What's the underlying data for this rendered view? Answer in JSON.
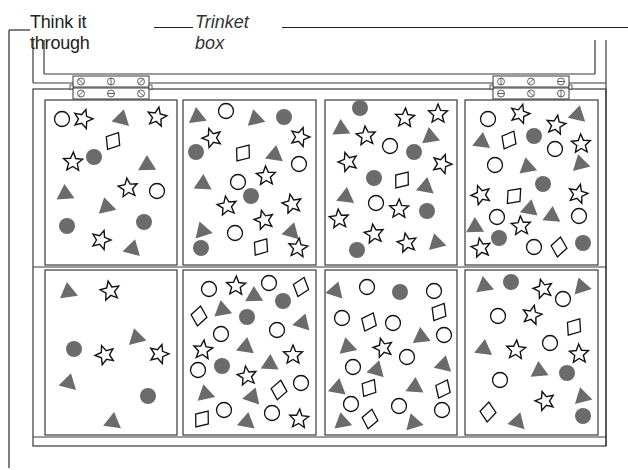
{
  "header": {
    "title": "Think it through",
    "subtitle": "Trinket box"
  },
  "colors": {
    "line": "#3a3a3a",
    "fill_shape": "#6b6b6b",
    "outline_shape": "#111111",
    "background": "#ffffff"
  },
  "compartments": [
    {
      "id": "top-1",
      "x": 45,
      "y": 100,
      "w": 132,
      "h": 165,
      "shapes": [
        [
          "circle-o",
          62,
          119
        ],
        [
          "star",
          83,
          119
        ],
        [
          "tri",
          122,
          117
        ],
        [
          "star",
          157,
          117
        ],
        [
          "diamond",
          113,
          141
        ],
        [
          "circle-f",
          94,
          157
        ],
        [
          "star",
          73,
          162
        ],
        [
          "tri",
          147,
          163
        ],
        [
          "tri",
          65,
          192
        ],
        [
          "star",
          128,
          188
        ],
        [
          "circle-o",
          157,
          191
        ],
        [
          "tri",
          106,
          205
        ],
        [
          "circle-f",
          67,
          226
        ],
        [
          "circle-f",
          144,
          222
        ],
        [
          "star",
          101,
          240
        ],
        [
          "tri",
          133,
          247
        ]
      ]
    },
    {
      "id": "top-2",
      "x": 183,
      "y": 100,
      "w": 133,
      "h": 165,
      "shapes": [
        [
          "tri",
          197,
          115
        ],
        [
          "circle-o",
          226,
          111
        ],
        [
          "tri",
          255,
          117
        ],
        [
          "circle-f",
          284,
          117
        ],
        [
          "star",
          212,
          138
        ],
        [
          "star",
          300,
          137
        ],
        [
          "circle-f",
          196,
          152
        ],
        [
          "diamond",
          243,
          153
        ],
        [
          "tri",
          275,
          153
        ],
        [
          "circle-o",
          299,
          164
        ],
        [
          "tri",
          203,
          182
        ],
        [
          "circle-o",
          238,
          182
        ],
        [
          "star",
          266,
          176
        ],
        [
          "circle-f",
          251,
          196
        ],
        [
          "star",
          227,
          206
        ],
        [
          "star",
          292,
          204
        ],
        [
          "star",
          264,
          220
        ],
        [
          "tri",
          202,
          229
        ],
        [
          "circle-o",
          235,
          233
        ],
        [
          "tri",
          292,
          230
        ],
        [
          "circle-f",
          201,
          248
        ],
        [
          "diamond",
          261,
          247
        ],
        [
          "star",
          298,
          248
        ]
      ]
    },
    {
      "id": "top-3",
      "x": 325,
      "y": 100,
      "w": 132,
      "h": 165,
      "shapes": [
        [
          "circle-f",
          360,
          108
        ],
        [
          "star",
          405,
          118
        ],
        [
          "star",
          438,
          114
        ],
        [
          "tri",
          341,
          127
        ],
        [
          "star",
          366,
          136
        ],
        [
          "tri",
          430,
          135
        ],
        [
          "circle-o",
          390,
          146
        ],
        [
          "circle-f",
          414,
          152
        ],
        [
          "star",
          348,
          162
        ],
        [
          "star",
          442,
          164
        ],
        [
          "circle-f",
          374,
          178
        ],
        [
          "diamond",
          402,
          180
        ],
        [
          "tri",
          426,
          185
        ],
        [
          "tri",
          346,
          195
        ],
        [
          "circle-o",
          376,
          203
        ],
        [
          "star",
          399,
          209
        ],
        [
          "circle-f",
          427,
          211
        ],
        [
          "star",
          339,
          219
        ],
        [
          "star",
          374,
          234
        ],
        [
          "star",
          407,
          243
        ],
        [
          "tri",
          436,
          241
        ],
        [
          "circle-f",
          357,
          250
        ]
      ]
    },
    {
      "id": "top-4",
      "x": 465,
      "y": 100,
      "w": 133,
      "h": 165,
      "shapes": [
        [
          "circle-o",
          488,
          119
        ],
        [
          "star",
          520,
          114
        ],
        [
          "tri",
          578,
          113
        ],
        [
          "star",
          556,
          125
        ],
        [
          "tri",
          482,
          140
        ],
        [
          "diamond",
          509,
          140
        ],
        [
          "circle-f",
          534,
          136
        ],
        [
          "star",
          581,
          144
        ],
        [
          "circle-o",
          555,
          149
        ],
        [
          "circle-o",
          495,
          165
        ],
        [
          "tri",
          527,
          165
        ],
        [
          "tri",
          580,
          162
        ],
        [
          "circle-f",
          543,
          184
        ],
        [
          "star",
          481,
          195
        ],
        [
          "diamond",
          514,
          196
        ],
        [
          "star",
          578,
          194
        ],
        [
          "tri",
          530,
          207
        ],
        [
          "circle-o",
          497,
          217
        ],
        [
          "tri",
          552,
          214
        ],
        [
          "circle-o",
          579,
          216
        ],
        [
          "tri",
          475,
          225
        ],
        [
          "star",
          521,
          226
        ],
        [
          "circle-f",
          499,
          238
        ],
        [
          "star",
          481,
          248
        ],
        [
          "circle-o",
          534,
          247
        ],
        [
          "diamond",
          559,
          247
        ],
        [
          "circle-f",
          583,
          243
        ]
      ]
    },
    {
      "id": "bottom-1",
      "x": 45,
      "y": 270,
      "w": 132,
      "h": 165,
      "shapes": [
        [
          "tri",
          68,
          290
        ],
        [
          "star",
          110,
          291
        ],
        [
          "tri",
          136,
          336
        ],
        [
          "circle-f",
          74,
          349
        ],
        [
          "star",
          105,
          355
        ],
        [
          "star",
          159,
          354
        ],
        [
          "tri",
          69,
          381
        ],
        [
          "circle-f",
          148,
          396
        ],
        [
          "tri",
          113,
          420
        ]
      ]
    },
    {
      "id": "bottom-2",
      "x": 183,
      "y": 270,
      "w": 133,
      "h": 165,
      "shapes": [
        [
          "circle-o",
          209,
          289
        ],
        [
          "star",
          236,
          286
        ],
        [
          "tri",
          254,
          294
        ],
        [
          "circle-o",
          269,
          283
        ],
        [
          "diamond",
          301,
          287
        ],
        [
          "tri",
          222,
          308
        ],
        [
          "circle-f",
          283,
          301
        ],
        [
          "diamond",
          199,
          316
        ],
        [
          "circle-f",
          247,
          317
        ],
        [
          "tri",
          303,
          321
        ],
        [
          "circle-o",
          221,
          334
        ],
        [
          "circle-o",
          277,
          330
        ],
        [
          "tri",
          246,
          345
        ],
        [
          "star",
          203,
          350
        ],
        [
          "tri",
          270,
          362
        ],
        [
          "star",
          293,
          355
        ],
        [
          "circle-o",
          198,
          370
        ],
        [
          "circle-f",
          222,
          366
        ],
        [
          "star",
          247,
          376
        ],
        [
          "tri",
          205,
          392
        ],
        [
          "diamond",
          279,
          390
        ],
        [
          "circle-o",
          301,
          383
        ],
        [
          "tri",
          253,
          395
        ],
        [
          "circle-o",
          224,
          410
        ],
        [
          "diamond",
          202,
          419
        ],
        [
          "tri",
          247,
          420
        ],
        [
          "circle-o",
          272,
          413
        ],
        [
          "star",
          299,
          419
        ]
      ]
    },
    {
      "id": "bottom-3",
      "x": 325,
      "y": 270,
      "w": 132,
      "h": 165,
      "shapes": [
        [
          "tri",
          336,
          289
        ],
        [
          "circle-o",
          367,
          287
        ],
        [
          "circle-f",
          400,
          292
        ],
        [
          "circle-o",
          434,
          291
        ],
        [
          "diamond",
          439,
          312
        ],
        [
          "circle-o",
          342,
          318
        ],
        [
          "diamond",
          369,
          322
        ],
        [
          "circle-o",
          393,
          323
        ],
        [
          "tri",
          421,
          335
        ],
        [
          "circle-o",
          444,
          335
        ],
        [
          "tri",
          347,
          345
        ],
        [
          "star",
          383,
          348
        ],
        [
          "circle-o",
          407,
          357
        ],
        [
          "circle-o",
          353,
          367
        ],
        [
          "tri",
          377,
          368
        ],
        [
          "tri",
          444,
          363
        ],
        [
          "tri",
          338,
          386
        ],
        [
          "diamond",
          369,
          388
        ],
        [
          "tri",
          415,
          385
        ],
        [
          "diamond",
          443,
          389
        ],
        [
          "circle-o",
          351,
          404
        ],
        [
          "circle-o",
          399,
          406
        ],
        [
          "circle-o",
          442,
          410
        ],
        [
          "tri",
          342,
          420
        ],
        [
          "diamond",
          370,
          419
        ],
        [
          "tri",
          413,
          421
        ]
      ]
    },
    {
      "id": "bottom-4",
      "x": 465,
      "y": 270,
      "w": 133,
      "h": 165,
      "shapes": [
        [
          "tri",
          484,
          284
        ],
        [
          "circle-f",
          511,
          282
        ],
        [
          "star",
          543,
          289
        ],
        [
          "tri",
          581,
          285
        ],
        [
          "circle-o",
          563,
          299
        ],
        [
          "circle-o",
          498,
          316
        ],
        [
          "star",
          532,
          315
        ],
        [
          "diamond",
          574,
          327
        ],
        [
          "tri",
          484,
          347
        ],
        [
          "star",
          516,
          350
        ],
        [
          "circle-o",
          550,
          343
        ],
        [
          "star",
          579,
          354
        ],
        [
          "tri",
          539,
          369
        ],
        [
          "circle-f",
          567,
          373
        ],
        [
          "circle-o",
          500,
          380
        ],
        [
          "tri",
          582,
          395
        ],
        [
          "star",
          545,
          401
        ],
        [
          "diamond",
          488,
          412
        ],
        [
          "tri",
          518,
          420
        ],
        [
          "circle-f",
          583,
          416
        ]
      ]
    }
  ],
  "hinges": [
    {
      "id": "hinge-left",
      "x": 73,
      "y": 76,
      "screws_top": [
        "⊘",
        "⊖",
        "⊘"
      ],
      "screws_bottom": [
        "⊘",
        "⊘",
        "⊖"
      ]
    },
    {
      "id": "hinge-right",
      "x": 493,
      "y": 76,
      "screws_top": [
        "⊘",
        "⊖",
        "⊘"
      ],
      "screws_bottom": [
        "⊘",
        "⊖",
        "⊖"
      ]
    }
  ]
}
